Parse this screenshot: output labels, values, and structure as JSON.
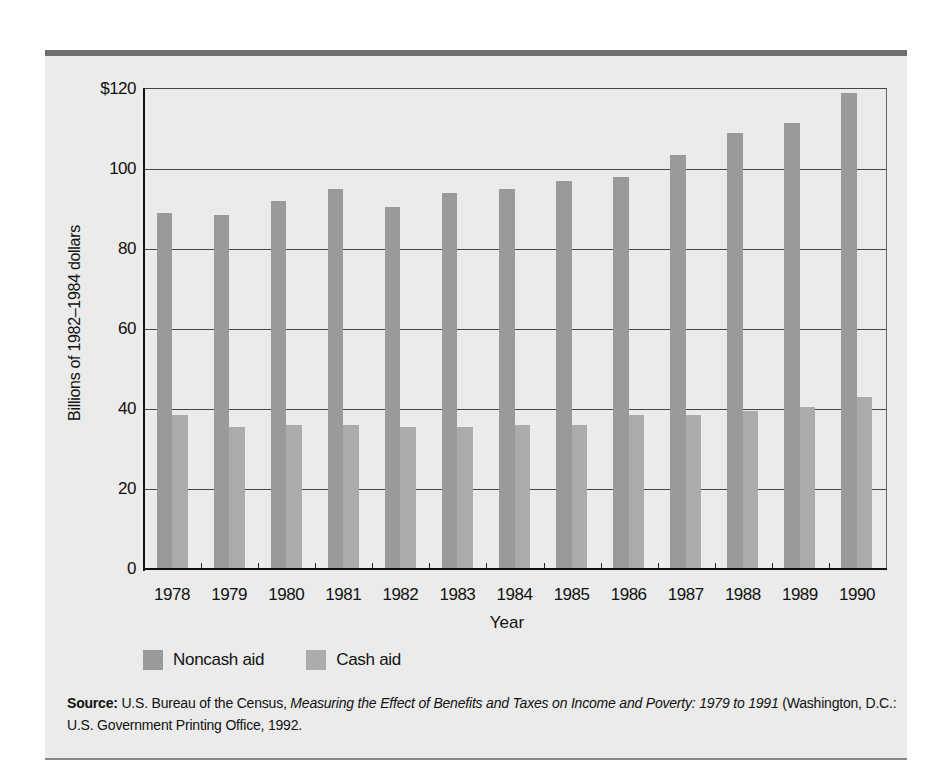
{
  "chart_data": {
    "type": "bar",
    "title": "",
    "xlabel": "Year",
    "ylabel": "Billions of 1982–1984 dollars",
    "ylim": [
      0,
      120
    ],
    "yticks": [
      0,
      20,
      40,
      60,
      80,
      100,
      120
    ],
    "ytick_labels": [
      "0",
      "20",
      "40",
      "60",
      "80",
      "100",
      "$120"
    ],
    "grid": "horizontal",
    "legend_position": "bottom-left",
    "categories": [
      "1978",
      "1979",
      "1980",
      "1981",
      "1982",
      "1983",
      "1984",
      "1985",
      "1986",
      "1987",
      "1988",
      "1989",
      "1990"
    ],
    "series": [
      {
        "name": "Noncash aid",
        "color": "#9a9a9a",
        "values": [
          89,
          88.5,
          92,
          95,
          90.5,
          94,
          95,
          97,
          98,
          103.5,
          109,
          111.5,
          119
        ]
      },
      {
        "name": "Cash aid",
        "color": "#ababab",
        "values": [
          38.5,
          35.5,
          36,
          36,
          35.5,
          35.5,
          36,
          36,
          38.5,
          38.5,
          39.5,
          40.5,
          43
        ]
      }
    ]
  },
  "legend": {
    "items": [
      {
        "label": "Noncash aid",
        "color": "#9a9a9a"
      },
      {
        "label": "Cash aid",
        "color": "#ababab"
      }
    ]
  },
  "source": {
    "label": "Source:",
    "text_plain_1": " U.S. Bureau of the Census, ",
    "text_italic_1": "Measuring the Effect of Benefits and Taxes on Income and Poverty: 1979 to 1991",
    "text_plain_2": " (Washington, D.C.: U.S. Government Printing Office, 1992."
  }
}
